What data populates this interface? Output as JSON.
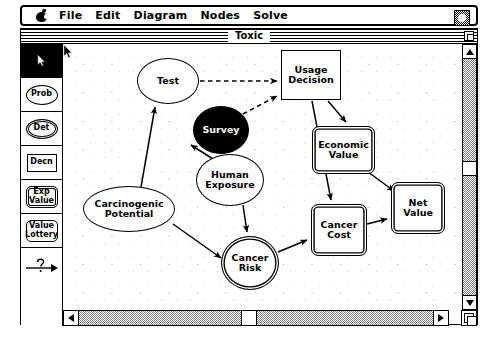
{
  "menubar": {
    "apple_icon": "apple-icon",
    "items": [
      {
        "label": "File"
      },
      {
        "label": "Edit"
      },
      {
        "label": "Diagram"
      },
      {
        "label": "Nodes"
      },
      {
        "label": "Solve"
      }
    ],
    "system_icon": "application-switcher-icon"
  },
  "window": {
    "title": "Toxic",
    "zoom_box": "zoom-box"
  },
  "palette": {
    "tools": [
      {
        "name": "select-arrow-tool",
        "label": "",
        "selected": true,
        "shape": "cursor"
      },
      {
        "name": "probability-node-tool",
        "label": "Prob",
        "selected": false,
        "shape": "oval"
      },
      {
        "name": "deterministic-node-tool",
        "label": "Det",
        "selected": false,
        "shape": "double-oval"
      },
      {
        "name": "decision-node-tool",
        "label": "Decn",
        "selected": false,
        "shape": "rect"
      },
      {
        "name": "expected-value-node-tool",
        "label": "Exp\nValue",
        "label_l1": "Exp",
        "label_l2": "Value",
        "selected": false,
        "shape": "double-rounded-rect"
      },
      {
        "name": "value-lottery-node-tool",
        "label": "Value\nLottery",
        "label_l1": "Value",
        "label_l2": "Lottery",
        "selected": false,
        "shape": "rounded-rect"
      },
      {
        "name": "arc-question-tool",
        "label": "",
        "selected": false,
        "shape": "arrow-question"
      }
    ]
  },
  "canvas": {
    "grid": "dotted",
    "cursor": "arrow-cursor",
    "nodes": [
      {
        "id": "test",
        "label": "Test",
        "label_l1": "Test",
        "label_l2": "",
        "shape": "oval",
        "x": 74,
        "y": 14,
        "w": 62,
        "h": 46,
        "filled": false
      },
      {
        "id": "survey",
        "label": "Survey",
        "label_l1": "Survey",
        "label_l2": "",
        "shape": "oval",
        "x": 130,
        "y": 62,
        "w": 56,
        "h": 48,
        "filled": true
      },
      {
        "id": "usage",
        "label": "Usage Decision",
        "label_l1": "Usage",
        "label_l2": "Decision",
        "shape": "rect",
        "x": 218,
        "y": 6,
        "w": 60,
        "h": 50,
        "filled": false
      },
      {
        "id": "carcino",
        "label": "Carcinogenic Potential",
        "label_l1": "Carcinogenic",
        "label_l2": "Potential",
        "shape": "oval",
        "x": 20,
        "y": 142,
        "w": 92,
        "h": 46,
        "filled": false
      },
      {
        "id": "human",
        "label": "Human Exposure",
        "label_l1": "Human",
        "label_l2": "Exposure",
        "shape": "oval",
        "x": 133,
        "y": 110,
        "w": 68,
        "h": 52,
        "filled": false
      },
      {
        "id": "cancerrisk",
        "label": "Cancer Risk",
        "label_l1": "Cancer",
        "label_l2": "Risk",
        "shape": "double-oval",
        "x": 158,
        "y": 192,
        "w": 58,
        "h": 54,
        "filled": false
      },
      {
        "id": "economic",
        "label": "Economic Value",
        "label_l1": "Economic",
        "label_l2": "Value",
        "shape": "double-rounded-rect",
        "x": 249,
        "y": 82,
        "w": 63,
        "h": 48,
        "filled": false
      },
      {
        "id": "cancercost",
        "label": "Cancer Cost",
        "label_l1": "Cancer",
        "label_l2": "Cost",
        "shape": "double-rounded-rect",
        "x": 248,
        "y": 160,
        "w": 56,
        "h": 52,
        "filled": false
      },
      {
        "id": "netvalue",
        "label": "Net Value",
        "label_l1": "Net",
        "label_l2": "Value",
        "shape": "double-rounded-rect",
        "x": 328,
        "y": 138,
        "w": 54,
        "h": 52,
        "filled": false
      }
    ],
    "arcs": [
      {
        "from": "test",
        "to": "usage",
        "style": "dashed"
      },
      {
        "from": "survey",
        "to": "usage",
        "style": "dashed"
      },
      {
        "from": "carcino",
        "to": "test",
        "style": "solid"
      },
      {
        "from": "human",
        "to": "survey",
        "style": "solid"
      },
      {
        "from": "human",
        "to": "cancerrisk",
        "style": "solid"
      },
      {
        "from": "carcino",
        "to": "cancerrisk",
        "style": "solid"
      },
      {
        "from": "usage",
        "to": "economic",
        "style": "solid"
      },
      {
        "from": "usage",
        "to": "cancercost",
        "style": "solid"
      },
      {
        "from": "cancerrisk",
        "to": "cancercost",
        "style": "solid"
      },
      {
        "from": "economic",
        "to": "netvalue",
        "style": "solid"
      },
      {
        "from": "cancercost",
        "to": "netvalue",
        "style": "solid"
      }
    ]
  },
  "scrollbars": {
    "vertical": {
      "thumb_position_pct": 44,
      "up_arrow": "scroll-up-arrow",
      "down_arrow": "scroll-down-arrow"
    },
    "horizontal": {
      "thumb_position_pct": 50,
      "left_arrow": "scroll-left-arrow",
      "right_arrow": "scroll-right-arrow"
    },
    "grow_box": "window-resize-grow-box"
  }
}
